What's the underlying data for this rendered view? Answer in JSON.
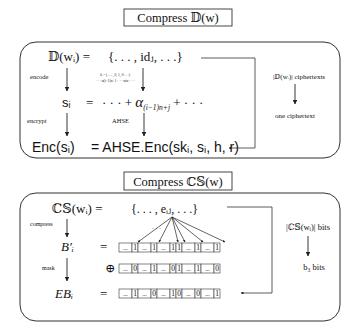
{
  "top": {
    "title": "Compress 𝔻(w)",
    "lhs": {
      "d": "𝔻(wᵢ) =",
      "s": "sᵢ",
      "s_eq": "=",
      "enc": "Enc(sᵢ)"
    },
    "rhs": {
      "set": "{. . . , idⱼ, . . .}",
      "s": "· · · + α(i−1)n+j + · · ·",
      "s_alpha": "α",
      "s_sub": "(i−1)n+j",
      "s_pre": "· · · + ",
      "s_post": " + · · ·",
      "enc": "= AHSE.Enc(skᵢ, sᵢ, h, r)"
    },
    "arrows": {
      "encode": "encode",
      "encrypt": "encrypt",
      "ahse": "AHSE",
      "tiny_line1": "δᵢ = (. . . , 0, 1, 0 . . .)",
      "tiny_line2": "· · · α(i−1)n+1 · · · αin · · ·"
    },
    "side": {
      "from": "|𝔻(wᵢ)| ciphertexts",
      "to": "one ciphertext"
    }
  },
  "bottom": {
    "title": "Compress ℂ𝕊(w)",
    "lhs": {
      "cs": "ℂ𝕊(wᵢ) =",
      "b": "B′ᵢ",
      "eb": "EBᵢ"
    },
    "rhs": {
      "set": "{. . . , eᵢⱼ, . . .}",
      "eq1": "=",
      "xor": "⊕",
      "eq2": "=",
      "dots": "· · ·"
    },
    "arrows": {
      "compress": "compress",
      "mask": "mask"
    },
    "bit_rows": {
      "b_prime": [
        "...",
        "1",
        "...",
        "1",
        "...",
        "1",
        "1",
        "...",
        "1",
        "...",
        "1"
      ],
      "mask": [
        "...",
        "0",
        "...",
        "1",
        "...",
        "0",
        "1",
        "...",
        "1",
        "...",
        "0"
      ],
      "eb": [
        "...",
        "1",
        "...",
        "0",
        "...",
        "1",
        "0",
        "...",
        "0",
        "...",
        "1"
      ]
    },
    "side": {
      "from": "|ℂ𝕊(wᵢ)| bits",
      "to": "b₃ bits"
    }
  }
}
